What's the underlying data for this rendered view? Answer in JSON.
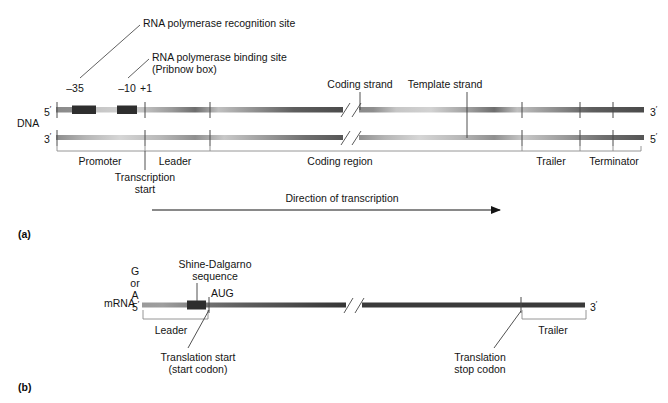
{
  "figure": {
    "panels": [
      {
        "letter": "(a)",
        "molecule_label": "DNA",
        "callouts": [
          "RNA polymerase recognition site",
          "RNA polymerase binding site",
          "(Pribnow box)"
        ],
        "position_markers": [
          "–35",
          "–10",
          "+1"
        ],
        "strand_labels": [
          "Coding strand",
          "Template strand"
        ],
        "end_labels": {
          "top_left": "5",
          "bottom_left": "3",
          "top_right": "3",
          "bottom_right": "5",
          "prime_mark": "′"
        },
        "regions": [
          "Promoter",
          "Leader",
          "Coding region",
          "Trailer",
          "Terminator"
        ],
        "annotations": [
          "Transcription",
          "start",
          "Direction of transcription"
        ]
      },
      {
        "letter": "(b)",
        "molecule_label": "mRNA",
        "cap_label": [
          "G",
          "or",
          "A"
        ],
        "callouts": [
          "Shine-Dalgarno",
          "sequence",
          "AUG"
        ],
        "end_labels": {
          "left": "5",
          "right": "3",
          "prime_mark": "′"
        },
        "regions": [
          "Leader",
          "Trailer"
        ],
        "annotations": [
          "Translation start",
          "(start codon)",
          "Translation",
          "stop codon"
        ]
      }
    ],
    "colors": {
      "ink": "#141414",
      "strand_dark": "#6b6b6b",
      "strand_light": "#c9c9c9",
      "box_fill": "#303030",
      "leader_line": "#9a9a9a",
      "bracket": "#7a7a7a"
    }
  }
}
